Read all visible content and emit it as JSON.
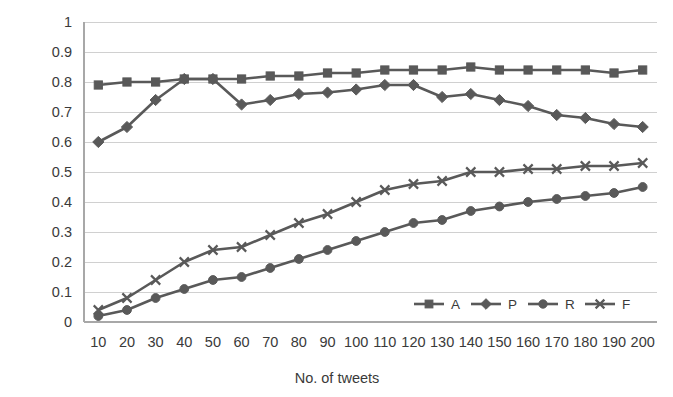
{
  "chart_data": {
    "type": "line",
    "title": "",
    "xlabel": "No. of tweets",
    "ylabel": "",
    "x": [
      10,
      20,
      30,
      40,
      50,
      60,
      70,
      80,
      90,
      100,
      110,
      120,
      130,
      140,
      150,
      160,
      170,
      180,
      190,
      200
    ],
    "xticklabels": [
      "10",
      "20",
      "30",
      "40",
      "50",
      "60",
      "70",
      "80",
      "90",
      "100",
      "110",
      "120",
      "130",
      "140",
      "150",
      "160",
      "170",
      "180",
      "190",
      "200"
    ],
    "yticklabels": [
      "0",
      "0.1",
      "0.2",
      "0.3",
      "0.4",
      "0.5",
      "0.6",
      "0.7",
      "0.8",
      "0.9",
      "1"
    ],
    "yticks": [
      0,
      0.1,
      0.2,
      0.3,
      0.4,
      0.5,
      0.6,
      0.7,
      0.8,
      0.9,
      1
    ],
    "ylim": [
      0,
      1
    ],
    "xlim": [
      10,
      200
    ],
    "grid": true,
    "grid_axis": "y",
    "legend_position": "bottom-right",
    "series": [
      {
        "name": "A",
        "marker": "square",
        "color": "#595959",
        "values": [
          0.79,
          0.8,
          0.8,
          0.81,
          0.81,
          0.81,
          0.82,
          0.82,
          0.83,
          0.83,
          0.84,
          0.84,
          0.84,
          0.85,
          0.84,
          0.84,
          0.84,
          0.84,
          0.83,
          0.84
        ]
      },
      {
        "name": "P",
        "marker": "diamond",
        "color": "#595959",
        "values": [
          0.6,
          0.65,
          0.74,
          0.81,
          0.81,
          0.725,
          0.74,
          0.76,
          0.765,
          0.775,
          0.79,
          0.79,
          0.75,
          0.76,
          0.74,
          0.72,
          0.69,
          0.68,
          0.66,
          0.65
        ]
      },
      {
        "name": "R",
        "marker": "circle",
        "color": "#595959",
        "values": [
          0.02,
          0.04,
          0.08,
          0.11,
          0.14,
          0.15,
          0.18,
          0.21,
          0.24,
          0.27,
          0.3,
          0.33,
          0.34,
          0.37,
          0.385,
          0.4,
          0.41,
          0.42,
          0.43,
          0.45
        ]
      },
      {
        "name": "F",
        "marker": "x",
        "color": "#595959",
        "values": [
          0.04,
          0.08,
          0.14,
          0.2,
          0.24,
          0.25,
          0.29,
          0.33,
          0.36,
          0.4,
          0.44,
          0.46,
          0.47,
          0.5,
          0.5,
          0.51,
          0.51,
          0.52,
          0.52,
          0.53
        ]
      }
    ]
  },
  "legend": {
    "items": [
      {
        "label": "A"
      },
      {
        "label": "P"
      },
      {
        "label": "R"
      },
      {
        "label": "F"
      }
    ]
  },
  "axis": {
    "x_title": "No. of tweets"
  },
  "colors": {
    "series": "#595959",
    "grid": "#d0d0d0",
    "axis": "#a8a8a8",
    "text": "#3a3a3a",
    "background": "#ffffff"
  }
}
